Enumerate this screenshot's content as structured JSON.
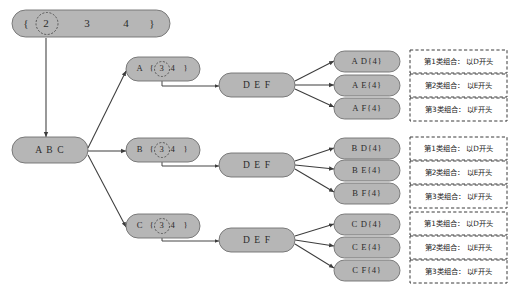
{
  "diagram": {
    "colors": {
      "node_fill": "#b6b6b6",
      "node_stroke": "#6f6f6f",
      "edge": "#3c3c3c",
      "dashed_box_stroke": "#3b3b3b",
      "background": "#ffffff",
      "text": "#2b2b2b"
    },
    "root": {
      "prefix": "{",
      "circled": "2",
      "rest_1": "3",
      "rest_2": "4",
      "suffix": "}"
    },
    "source_node": {
      "label": "A B C"
    },
    "branches": [
      {
        "id": "branch-a",
        "letter": "A",
        "open": "{",
        "circled": "3",
        "rest": "4",
        "close": "}",
        "middle_label": "D E F",
        "results": [
          {
            "label": "A D{4}",
            "note": "第1类组合： 以D开头"
          },
          {
            "label": "A E{4}",
            "note": "第2类组合： 以E开头"
          },
          {
            "label": "A F{4}",
            "note": "第3类组合： 以F开头"
          }
        ]
      },
      {
        "id": "branch-b",
        "letter": "B",
        "open": "{",
        "circled": "3",
        "rest": "4",
        "close": "}",
        "middle_label": "D E F",
        "results": [
          {
            "label": "B D{4}",
            "note": "第1类组合： 以D开头"
          },
          {
            "label": "B E{4}",
            "note": "第2类组合： 以E开头"
          },
          {
            "label": "B F{4}",
            "note": "第3类组合： 以F开头"
          }
        ]
      },
      {
        "id": "branch-c",
        "letter": "C",
        "open": "{",
        "circled": "3",
        "rest": "4",
        "close": "}",
        "middle_label": "D E F",
        "results": [
          {
            "label": "C D{4}",
            "note": "第1类组合： 以D开头"
          },
          {
            "label": "C E{4}",
            "note": "第2类组合： 以E开头"
          },
          {
            "label": "C F{4}",
            "note": "第3类组合： 以F开头"
          }
        ]
      }
    ]
  }
}
